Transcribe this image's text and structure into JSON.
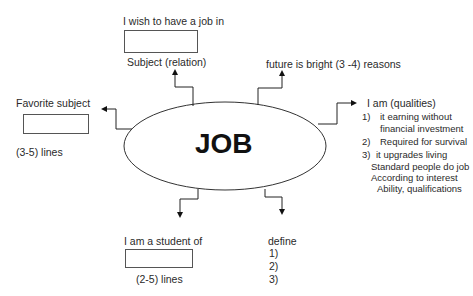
{
  "center": {
    "label": "JOB"
  },
  "top_left": {
    "heading": "I wish to have a job in",
    "caption": "Subject (relation)"
  },
  "top_right": {
    "heading": "future is bright (3 -4) reasons"
  },
  "left": {
    "heading": "Favorite subject",
    "caption": "(3-5) lines"
  },
  "right": {
    "heading": "I am (qualities)",
    "items": [
      {
        "num": "1)",
        "lines": [
          "it earning without",
          "financial investment"
        ]
      },
      {
        "num": "2)",
        "lines": [
          "Required for survival"
        ]
      },
      {
        "num": "3)",
        "lines": [
          "it upgrades living"
        ]
      }
    ],
    "extra": [
      "Standard people do job",
      "According to interest",
      "Ability, qualifications"
    ]
  },
  "bottom_left": {
    "heading": "I am a student of",
    "caption": "(2-5) lines"
  },
  "bottom_right": {
    "heading": "define",
    "items": [
      "1)",
      "2)",
      "3)"
    ]
  }
}
